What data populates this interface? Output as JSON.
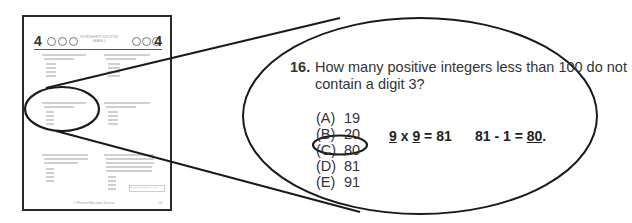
{
  "thumbnail": {
    "header": {
      "left_number": "4",
      "right_number": "4",
      "title_line1": "WORKSHEETS SOLUTION",
      "title_line2": "GRADE 4"
    },
    "footer_text": "© Pearson Education Services",
    "footer_page": "41",
    "continue_button": "GO ON TO NEXT PAGE"
  },
  "callout": {
    "question_number": "16.",
    "question_text": "How many positive integers less than 100 do not contain a digit 3?",
    "choices": [
      {
        "label": "(A)",
        "value": "19",
        "selected": false
      },
      {
        "label": "(B)",
        "value": "20",
        "selected": false
      },
      {
        "label": "(C)",
        "value": "80",
        "selected": true
      },
      {
        "label": "(D)",
        "value": "81",
        "selected": false
      },
      {
        "label": "(E)",
        "value": "91",
        "selected": false
      }
    ],
    "work": {
      "step1_a": "9",
      "step1_op": " x ",
      "step1_b": "9",
      "step1_rest": " = 81",
      "step2_prefix": "81 - 1 = ",
      "step2_answer": "80",
      "step2_suffix": "."
    }
  },
  "colors": {
    "ink": "#222222",
    "line": "#1a1a1a",
    "page_border": "#2a2a2a"
  }
}
